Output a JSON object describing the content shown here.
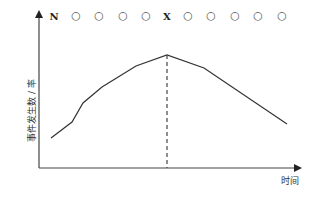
{
  "diagram": {
    "top_sequence": [
      {
        "text": "N",
        "type": "label",
        "x": 54
      },
      {
        "text": "○",
        "type": "circle",
        "x": 76
      },
      {
        "text": "○",
        "type": "circle",
        "x": 99
      },
      {
        "text": "○",
        "type": "circle",
        "x": 123
      },
      {
        "text": "○",
        "type": "circle",
        "x": 146
      },
      {
        "text": "X",
        "type": "label",
        "x": 167
      },
      {
        "text": "○",
        "type": "circle",
        "x": 188
      },
      {
        "text": "○",
        "type": "circle",
        "x": 211
      },
      {
        "text": "○",
        "type": "circle",
        "x": 235
      },
      {
        "text": "○",
        "type": "circle",
        "x": 258
      },
      {
        "text": "○",
        "type": "circle",
        "x": 282
      }
    ],
    "y_axis_label": "事件发生数 / 率",
    "x_axis_label": "时间",
    "curve_points": [
      [
        51,
        138
      ],
      [
        72,
        122
      ],
      [
        83,
        103
      ],
      [
        102,
        87
      ],
      [
        136,
        66
      ],
      [
        167,
        55
      ],
      [
        204,
        68
      ],
      [
        287,
        124
      ]
    ],
    "peak_marker": {
      "x": 167,
      "y_top": 55,
      "y_bottom": 168,
      "style": "dashed"
    },
    "colors": {
      "line": "#333333",
      "axis": "#444444"
    }
  }
}
